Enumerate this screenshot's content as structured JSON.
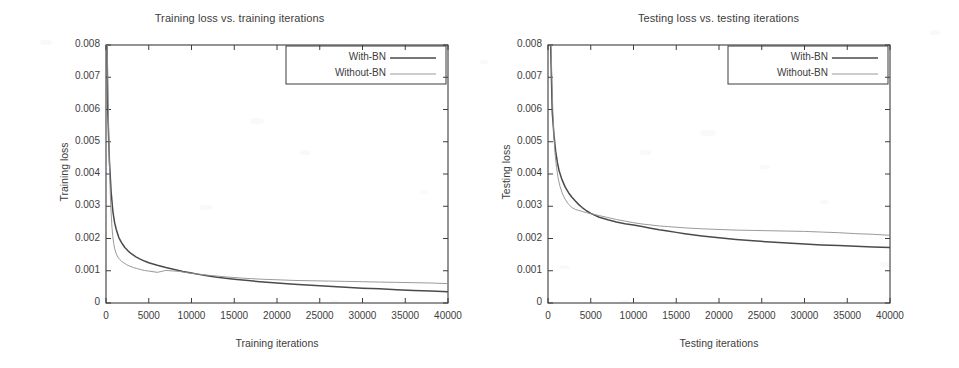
{
  "figure": {
    "background": "#ffffff",
    "ink_color": "#3d3d3d"
  },
  "chart_data": [
    {
      "type": "line",
      "title": "Training loss vs. training iterations",
      "xlabel": "Training iterations",
      "ylabel": "Training loss",
      "xlim": [
        0,
        40000
      ],
      "ylim": [
        0,
        0.008
      ],
      "xticks": [
        0,
        5000,
        10000,
        15000,
        20000,
        25000,
        30000,
        35000,
        40000
      ],
      "xticklabels": [
        "0",
        "5000",
        "10000",
        "15000",
        "20000",
        "25000",
        "30000",
        "35000",
        "40000"
      ],
      "yticks": [
        0,
        0.001,
        0.002,
        0.003,
        0.004,
        0.005,
        0.006,
        0.007,
        0.008
      ],
      "yticklabels": [
        "0",
        "0.001",
        "0.002",
        "0.003",
        "0.004",
        "0.005",
        "0.006",
        "0.007",
        "0.008"
      ],
      "grid": false,
      "legend_position": "top-right",
      "series": [
        {
          "name": "With-BN",
          "color": "#4a4a4a",
          "width": 1.5,
          "style": "solid",
          "x": [
            200,
            400,
            600,
            800,
            1000,
            1200,
            1500,
            1800,
            2200,
            2600,
            3000,
            3500,
            4000,
            4500,
            5000,
            6000,
            7000,
            8000,
            8500,
            9000,
            10000,
            11000,
            12000,
            13000,
            14000,
            15000,
            16000,
            18000,
            20000,
            22000,
            24000,
            26000,
            28000,
            30000,
            32000,
            34000,
            36000,
            38000,
            40000
          ],
          "y": [
            0.006,
            0.0044,
            0.00345,
            0.00285,
            0.0025,
            0.00228,
            0.00203,
            0.00188,
            0.00172,
            0.00161,
            0.00152,
            0.00143,
            0.00136,
            0.0013,
            0.00125,
            0.00117,
            0.0011,
            0.00104,
            0.00101,
            0.00098,
            0.00093,
            0.00088,
            0.00084,
            0.0008,
            0.00077,
            0.00074,
            0.00071,
            0.00066,
            0.00062,
            0.00058,
            0.00055,
            0.00052,
            0.00049,
            0.00046,
            0.00044,
            0.00041,
            0.00039,
            0.00037,
            0.00035
          ]
        },
        {
          "name": "Without-BN",
          "color": "#8f8f8f",
          "width": 0.9,
          "style": "solid",
          "x": [
            200,
            300,
            400,
            500,
            600,
            700,
            800,
            900,
            1000,
            1200,
            1400,
            1600,
            1800,
            2000,
            2400,
            2800,
            3200,
            3600,
            4000,
            4500,
            5000,
            6000,
            7000,
            8000,
            8500,
            9000,
            10000,
            11000,
            12000,
            14000,
            16000,
            18000,
            20000,
            22000,
            24000,
            26000,
            28000,
            30000,
            32000,
            34000,
            36000,
            38000,
            40000
          ],
          "y": [
            0.0071,
            0.0056,
            0.0043,
            0.0034,
            0.0028,
            0.00235,
            0.00205,
            0.00185,
            0.0017,
            0.00152,
            0.00142,
            0.00135,
            0.0013,
            0.00126,
            0.00119,
            0.00114,
            0.0011,
            0.00107,
            0.00104,
            0.00101,
            0.00099,
            0.00095,
            0.00101,
            0.00099,
            0.00098,
            0.00096,
            0.00092,
            0.00089,
            0.00086,
            0.00081,
            0.00077,
            0.00074,
            0.00072,
            0.0007,
            0.00069,
            0.00068,
            0.00067,
            0.00066,
            0.00065,
            0.00064,
            0.00063,
            0.00062,
            0.0006
          ]
        }
      ]
    },
    {
      "type": "line",
      "title": "Testing loss vs. testing iterations",
      "xlabel": "Testing iterations",
      "ylabel": "Testing loss",
      "xlim": [
        0,
        40000
      ],
      "ylim": [
        0,
        0.008
      ],
      "xticks": [
        0,
        5000,
        10000,
        15000,
        20000,
        25000,
        30000,
        35000,
        40000
      ],
      "xticklabels": [
        "0",
        "5000",
        "10000",
        "15000",
        "20000",
        "25000",
        "30000",
        "35000",
        "40000"
      ],
      "yticks": [
        0,
        0.001,
        0.002,
        0.003,
        0.004,
        0.005,
        0.006,
        0.007,
        0.008
      ],
      "yticklabels": [
        "0",
        "0.001",
        "0.002",
        "0.003",
        "0.004",
        "0.005",
        "0.006",
        "0.007",
        "0.008"
      ],
      "grid": false,
      "legend_position": "top-right",
      "series": [
        {
          "name": "With-BN",
          "color": "#4a4a4a",
          "width": 1.5,
          "style": "solid",
          "x": [
            500,
            700,
            900,
            1100,
            1300,
            1600,
            2000,
            2400,
            2800,
            3200,
            3600,
            4000,
            4500,
            5000,
            6000,
            7000,
            8000,
            9000,
            10000,
            11000,
            12000,
            13000,
            14000,
            15000,
            16000,
            18000,
            20000,
            22000,
            24000,
            26000,
            28000,
            30000,
            32000,
            34000,
            36000,
            38000,
            40000
          ],
          "y": [
            0.0059,
            0.0052,
            0.0047,
            0.00435,
            0.0041,
            0.00385,
            0.0036,
            0.00342,
            0.00328,
            0.00316,
            0.00305,
            0.00296,
            0.00286,
            0.00278,
            0.00266,
            0.00258,
            0.00251,
            0.00246,
            0.00242,
            0.00237,
            0.00232,
            0.00227,
            0.00223,
            0.00219,
            0.00215,
            0.00208,
            0.00202,
            0.00197,
            0.00193,
            0.00189,
            0.00186,
            0.00183,
            0.0018,
            0.00178,
            0.00176,
            0.00174,
            0.00172
          ]
        },
        {
          "name": "Without-BN",
          "color": "#8f8f8f",
          "width": 0.9,
          "style": "solid",
          "x": [
            350,
            450,
            550,
            700,
            850,
            1000,
            1200,
            1400,
            1700,
            2000,
            2400,
            2800,
            3200,
            3600,
            4000,
            4500,
            5000,
            6000,
            7000,
            8000,
            9000,
            10000,
            11000,
            12000,
            13000,
            14000,
            16000,
            18000,
            20000,
            22000,
            24000,
            26000,
            28000,
            30000,
            32000,
            34000,
            36000,
            38000,
            40000
          ],
          "y": [
            0.008,
            0.007,
            0.0061,
            0.0051,
            0.00455,
            0.0042,
            0.00385,
            0.00362,
            0.00338,
            0.00322,
            0.00306,
            0.00296,
            0.0029,
            0.00287,
            0.00284,
            0.0028,
            0.00277,
            0.00271,
            0.00265,
            0.00259,
            0.00254,
            0.00249,
            0.00245,
            0.00242,
            0.00239,
            0.00237,
            0.00233,
            0.0023,
            0.00228,
            0.00226,
            0.00225,
            0.00224,
            0.00223,
            0.00222,
            0.0022,
            0.00218,
            0.00215,
            0.00213,
            0.0021
          ]
        }
      ]
    }
  ]
}
